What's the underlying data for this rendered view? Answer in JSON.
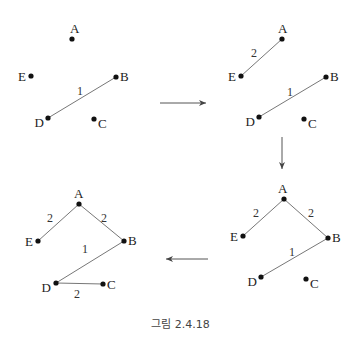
{
  "caption": "그림 2.4.18",
  "colors": {
    "edge": "#777777",
    "node": "#111111",
    "arrow": "#555555"
  },
  "panels": [
    {
      "id": "step1",
      "nodes": [
        {
          "label": "A",
          "x": 72,
          "y": 39,
          "lx": 70,
          "ly": 33,
          "anchor": "start"
        },
        {
          "label": "E",
          "x": 31,
          "y": 76,
          "lx": 26,
          "ly": 81,
          "anchor": "end"
        },
        {
          "label": "B",
          "x": 116,
          "y": 77,
          "lx": 120,
          "ly": 81,
          "anchor": "start"
        },
        {
          "label": "D",
          "x": 48,
          "y": 118,
          "lx": 44,
          "ly": 127,
          "anchor": "end"
        },
        {
          "label": "C",
          "x": 94,
          "y": 119,
          "lx": 98,
          "ly": 128,
          "anchor": "start"
        }
      ],
      "edges": [
        {
          "from": "D",
          "to": "B",
          "weight": "1",
          "wx": 80,
          "wy": 95
        }
      ]
    },
    {
      "id": "step2",
      "nodes": [
        {
          "label": "A",
          "x": 282,
          "y": 39,
          "lx": 278,
          "ly": 33,
          "anchor": "start"
        },
        {
          "label": "E",
          "x": 241,
          "y": 76,
          "lx": 236,
          "ly": 81,
          "anchor": "end"
        },
        {
          "label": "B",
          "x": 326,
          "y": 77,
          "lx": 330,
          "ly": 81,
          "anchor": "start"
        },
        {
          "label": "D",
          "x": 259,
          "y": 117,
          "lx": 255,
          "ly": 126,
          "anchor": "end"
        },
        {
          "label": "C",
          "x": 304,
          "y": 119,
          "lx": 308,
          "ly": 128,
          "anchor": "start"
        }
      ],
      "edges": [
        {
          "from": "E",
          "to": "A",
          "weight": "2",
          "wx": 254,
          "wy": 57
        },
        {
          "from": "D",
          "to": "B",
          "weight": "1",
          "wx": 290,
          "wy": 96
        }
      ]
    },
    {
      "id": "step3",
      "nodes": [
        {
          "label": "A",
          "x": 284,
          "y": 199,
          "lx": 278,
          "ly": 193,
          "anchor": "start"
        },
        {
          "label": "E",
          "x": 243,
          "y": 236,
          "lx": 238,
          "ly": 241,
          "anchor": "end"
        },
        {
          "label": "B",
          "x": 328,
          "y": 238,
          "lx": 332,
          "ly": 242,
          "anchor": "start"
        },
        {
          "label": "D",
          "x": 261,
          "y": 277,
          "lx": 257,
          "ly": 286,
          "anchor": "end"
        },
        {
          "label": "C",
          "x": 306,
          "y": 279,
          "lx": 310,
          "ly": 288,
          "anchor": "start"
        }
      ],
      "edges": [
        {
          "from": "E",
          "to": "A",
          "weight": "2",
          "wx": 256,
          "wy": 217
        },
        {
          "from": "A",
          "to": "B",
          "weight": "2",
          "wx": 311,
          "wy": 217
        },
        {
          "from": "D",
          "to": "B",
          "weight": "1",
          "wx": 292,
          "wy": 256
        }
      ]
    },
    {
      "id": "step4",
      "nodes": [
        {
          "label": "A",
          "x": 79,
          "y": 204,
          "lx": 74,
          "ly": 198,
          "anchor": "start"
        },
        {
          "label": "E",
          "x": 38,
          "y": 241,
          "lx": 33,
          "ly": 246,
          "anchor": "end"
        },
        {
          "label": "B",
          "x": 124,
          "y": 241,
          "lx": 128,
          "ly": 245,
          "anchor": "start"
        },
        {
          "label": "D",
          "x": 56,
          "y": 283,
          "lx": 51,
          "ly": 292,
          "anchor": "end"
        },
        {
          "label": "C",
          "x": 103,
          "y": 284,
          "lx": 107,
          "ly": 289,
          "anchor": "start"
        }
      ],
      "edges": [
        {
          "from": "E",
          "to": "A",
          "weight": "2",
          "wx": 50,
          "wy": 222
        },
        {
          "from": "A",
          "to": "B",
          "weight": "2",
          "wx": 104,
          "wy": 222
        },
        {
          "from": "D",
          "to": "B",
          "weight": "1",
          "wx": 85,
          "wy": 253
        },
        {
          "from": "D",
          "to": "C",
          "weight": "2",
          "wx": 77,
          "wy": 298
        }
      ]
    }
  ],
  "arrows": [
    {
      "id": "right",
      "x1": 160,
      "y1": 103,
      "x2": 206,
      "y2": 103
    },
    {
      "id": "down",
      "x1": 282,
      "y1": 137,
      "x2": 282,
      "y2": 169
    },
    {
      "id": "left",
      "x1": 208,
      "y1": 259,
      "x2": 166,
      "y2": 259
    }
  ]
}
